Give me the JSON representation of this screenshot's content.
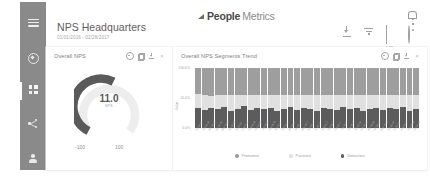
{
  "sidebar": {
    "items": [
      {
        "name": "menu-icon",
        "label": "Menu"
      },
      {
        "name": "compass-icon",
        "label": "Explore"
      },
      {
        "name": "grid-icon",
        "label": "Dashboards"
      },
      {
        "name": "share-icon",
        "label": "Share"
      },
      {
        "name": "person-icon",
        "label": "Account"
      }
    ]
  },
  "topbar": {
    "brand_bold": "People",
    "brand_light": "Metrics",
    "icons": [
      {
        "name": "download-icon",
        "label": "Download"
      },
      {
        "name": "filter-icon",
        "label": "Filter"
      },
      {
        "name": "report-icon",
        "label": "Report"
      },
      {
        "name": "gear-icon",
        "label": "Settings"
      }
    ],
    "bell_label": "Notifications"
  },
  "heading": {
    "title": "NPS Headquarters",
    "subtitle": "01/01/2016 - 02/28/2017"
  },
  "widgets": {
    "tools": [
      {
        "name": "gear-icon",
        "label": "Settings"
      },
      {
        "name": "copy-icon",
        "label": "Duplicate"
      },
      {
        "name": "download-icon",
        "label": "Download"
      },
      {
        "name": "close-icon",
        "label": "×"
      }
    ],
    "gauge": {
      "title": "Overall NPS",
      "value": "11.0",
      "unit": "NPS",
      "min_label": "-100",
      "max_label": "100"
    },
    "trend": {
      "title": "Overall NPS Segments Trend"
    }
  },
  "chart_data": {
    "type": "bar",
    "title": "Overall NPS Segments Trend",
    "stacked": true,
    "xlabel": "",
    "ylabel": "Value",
    "ylim": [
      0,
      100
    ],
    "yticks": [
      0,
      50,
      100
    ],
    "ytick_labels": [
      "0.0%",
      "50.0%",
      "100.0%"
    ],
    "grid": true,
    "legend_position": "bottom",
    "colors": {
      "Promoters": "#9e9e9e",
      "Passives": "#e0e0e0",
      "Detractors": "#5c5c5c"
    },
    "categories": [
      "Jan 2016",
      "Feb 2016",
      "Mar 2016",
      "Apr 2016",
      "May 2016",
      "Jun 2016",
      "Jul 2016",
      "Aug 2016",
      "Sep 2016",
      "Oct 2016",
      "Nov 2016",
      "Dec 2016",
      "Jan 2017",
      "Feb 2017",
      "Mar 2017",
      "Apr 2017",
      "May 2017",
      "Jun 2017",
      "Jul 2017",
      "Aug 2017",
      "Sep 2017",
      "Oct 2017",
      "Nov 2017",
      "Dec 2017",
      "Jan 2018",
      "Feb 2018",
      "Mar 2018",
      "Apr 2018",
      "May 2018",
      "Jun 2018",
      "Jul 2018",
      "Aug 2018",
      "Sep 2018",
      "Oct 2018"
    ],
    "series": [
      {
        "name": "Detractors",
        "values": [
          34,
          30,
          33,
          31,
          35,
          29,
          32,
          36,
          30,
          33,
          31,
          34,
          28,
          32,
          35,
          30,
          33,
          31,
          29,
          34,
          32,
          30,
          35,
          31,
          33,
          29,
          32,
          34,
          30,
          33,
          31,
          35,
          29,
          32
        ]
      },
      {
        "name": "Passives",
        "values": [
          22,
          25,
          21,
          24,
          20,
          26,
          23,
          19,
          25,
          22,
          24,
          21,
          27,
          23,
          20,
          25,
          22,
          24,
          26,
          21,
          23,
          25,
          20,
          24,
          22,
          26,
          23,
          21,
          25,
          22,
          24,
          20,
          26,
          23
        ]
      },
      {
        "name": "Promoters",
        "values": [
          44,
          45,
          46,
          45,
          45,
          45,
          45,
          45,
          45,
          45,
          45,
          45,
          45,
          45,
          45,
          45,
          45,
          45,
          45,
          45,
          45,
          45,
          45,
          45,
          45,
          45,
          45,
          45,
          45,
          45,
          45,
          45,
          45,
          45
        ]
      }
    ]
  }
}
